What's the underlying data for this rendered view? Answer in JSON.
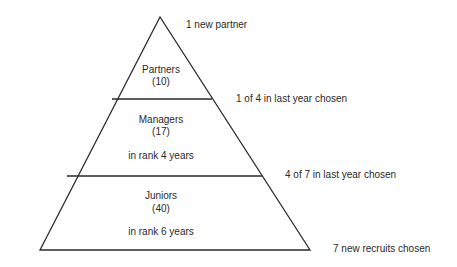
{
  "pyramid": {
    "tiers": [
      {
        "title": "Partners",
        "count": "(10)",
        "note": ""
      },
      {
        "title": "Managers",
        "count": "(17)",
        "note": "in rank 4 years"
      },
      {
        "title": "Juniors",
        "count": "(40)",
        "note": "in rank 6 years"
      }
    ],
    "annotations": {
      "top": "1 new partner",
      "partners_managers": "1 of 4 in last year chosen",
      "managers_juniors": "4 of 7 in last year chosen",
      "base": "7 new recruits chosen"
    }
  }
}
